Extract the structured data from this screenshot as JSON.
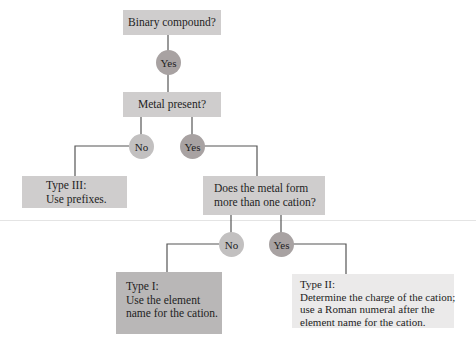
{
  "diagram": {
    "colors": {
      "box_default": "#cfcdcd",
      "box_type1": "#b9b7b7",
      "box_type2": "#ebeaea",
      "circle_yes": "#a8a2a2",
      "circle_no": "#c2c0c0",
      "connector": "#555555"
    },
    "nodes": {
      "binary_compound": {
        "text": "Binary compound?"
      },
      "yes_1": {
        "text": "Yes"
      },
      "metal_present": {
        "text": "Metal present?"
      },
      "no_2": {
        "text": "No"
      },
      "yes_2": {
        "text": "Yes"
      },
      "type3": {
        "line1": "Type III:",
        "line2": "Use prefixes."
      },
      "multi_cation": {
        "line1": "Does the metal form",
        "line2": "more than one cation?"
      },
      "no_3": {
        "text": "No"
      },
      "yes_3": {
        "text": "Yes"
      },
      "type1": {
        "line1": "Type I:",
        "line2": "Use the element",
        "line3": "name for the cation."
      },
      "type2": {
        "line1": "Type II:",
        "line2": "Determine the charge of the cation;",
        "line3": "use a Roman numeral after the",
        "line4": "element name for the cation."
      }
    },
    "edges": [
      {
        "from": "binary_compound",
        "to": "yes_1"
      },
      {
        "from": "yes_1",
        "to": "metal_present"
      },
      {
        "from": "metal_present",
        "to": "no_2"
      },
      {
        "from": "metal_present",
        "to": "yes_2"
      },
      {
        "from": "no_2",
        "to": "type3"
      },
      {
        "from": "yes_2",
        "to": "multi_cation"
      },
      {
        "from": "multi_cation",
        "to": "no_3"
      },
      {
        "from": "multi_cation",
        "to": "yes_3"
      },
      {
        "from": "no_3",
        "to": "type1"
      },
      {
        "from": "yes_3",
        "to": "type2"
      }
    ]
  }
}
